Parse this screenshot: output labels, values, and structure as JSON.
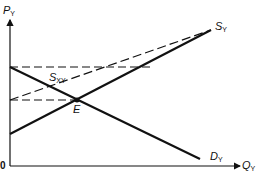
{
  "diagram": {
    "type": "supply-demand",
    "axes": {
      "y_label": {
        "main": "P",
        "sub": "Y"
      },
      "x_label": {
        "main": "Q",
        "sub": "Y"
      },
      "origin_label": "0"
    },
    "curves": [
      {
        "name": "supply",
        "label": {
          "main": "S",
          "sub": "Y"
        },
        "style": "solid"
      },
      {
        "name": "demand",
        "label": {
          "main": "D",
          "sub": "Y"
        },
        "style": "solid"
      },
      {
        "name": "excess-supply",
        "label": {
          "main": "S",
          "sub": "XY"
        },
        "style": "dashed"
      }
    ],
    "points": [
      {
        "name": "equilibrium",
        "label": "E"
      }
    ],
    "guides": [
      {
        "name": "upper-price-line",
        "style": "dashed"
      },
      {
        "name": "equilibrium-price-line",
        "style": "dashed"
      }
    ],
    "colors": {
      "line": "#111111",
      "background": "#ffffff"
    }
  }
}
